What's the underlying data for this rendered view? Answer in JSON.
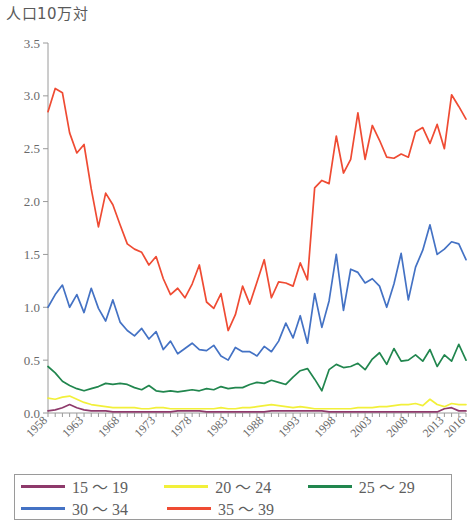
{
  "unit_label": "人口10万対",
  "legend": {
    "rows": [
      [
        {
          "label": "15 ～ 19",
          "color": "#8e3a6b"
        },
        {
          "label": "20 ～ 24",
          "color": "#f2f03a"
        },
        {
          "label": "25 ～ 29",
          "color": "#21864e"
        }
      ],
      [
        {
          "label": "30 ～ 34",
          "color": "#4472c4"
        },
        {
          "label": "35 ～ 39",
          "color": "#ef4b33"
        }
      ]
    ]
  },
  "chart_data": {
    "type": "line",
    "title": "",
    "subtitle": "",
    "xlabel": "",
    "ylabel": "人口10万対",
    "ylim": [
      0.0,
      3.5
    ],
    "ytick_labels": [
      "0.0",
      "0.5",
      "1.0",
      "1.5",
      "2.0",
      "2.5",
      "3.0",
      "3.5"
    ],
    "ytick_values": [
      0.0,
      0.5,
      1.0,
      1.5,
      2.0,
      2.5,
      3.0,
      3.5
    ],
    "xlim": [
      1958,
      2016
    ],
    "xtick_labels": [
      "1958",
      "1963",
      "1968",
      "1973",
      "1978",
      "1983",
      "1988",
      "1993",
      "1998",
      "2003",
      "2008",
      "2013",
      "2016"
    ],
    "xtick_values": [
      1958,
      1963,
      1968,
      1973,
      1978,
      1983,
      1988,
      1993,
      1998,
      2003,
      2008,
      2013,
      2016
    ],
    "grid": false,
    "legend_position": "bottom",
    "x": [
      1958,
      1959,
      1960,
      1961,
      1962,
      1963,
      1964,
      1965,
      1966,
      1967,
      1968,
      1969,
      1970,
      1971,
      1972,
      1973,
      1974,
      1975,
      1976,
      1977,
      1978,
      1979,
      1980,
      1981,
      1982,
      1983,
      1984,
      1985,
      1986,
      1987,
      1988,
      1989,
      1990,
      1991,
      1992,
      1993,
      1994,
      1995,
      1996,
      1997,
      1998,
      1999,
      2000,
      2001,
      2002,
      2003,
      2004,
      2005,
      2006,
      2007,
      2008,
      2009,
      2010,
      2011,
      2012,
      2013,
      2014,
      2015,
      2016
    ],
    "series": [
      {
        "name": "15 ～ 19",
        "color": "#8e3a6b",
        "values": [
          0.02,
          0.03,
          0.05,
          0.08,
          0.05,
          0.03,
          0.02,
          0.02,
          0.02,
          0.01,
          0.01,
          0.01,
          0.01,
          0.01,
          0.01,
          0.01,
          0.01,
          0.01,
          0.02,
          0.02,
          0.02,
          0.02,
          0.01,
          0.01,
          0.01,
          0.01,
          0.01,
          0.01,
          0.01,
          0.01,
          0.01,
          0.02,
          0.02,
          0.02,
          0.02,
          0.02,
          0.02,
          0.02,
          0.02,
          0.01,
          0.01,
          0.01,
          0.01,
          0.01,
          0.01,
          0.01,
          0.01,
          0.01,
          0.01,
          0.01,
          0.01,
          0.01,
          0.01,
          0.01,
          0.01,
          0.04,
          0.05,
          0.02,
          0.02
        ]
      },
      {
        "name": "20 ～ 24",
        "color": "#f2f03a",
        "values": [
          0.14,
          0.13,
          0.15,
          0.16,
          0.13,
          0.1,
          0.08,
          0.07,
          0.06,
          0.05,
          0.05,
          0.05,
          0.05,
          0.04,
          0.04,
          0.05,
          0.05,
          0.04,
          0.04,
          0.04,
          0.04,
          0.04,
          0.04,
          0.04,
          0.05,
          0.04,
          0.04,
          0.05,
          0.05,
          0.06,
          0.07,
          0.08,
          0.07,
          0.06,
          0.05,
          0.06,
          0.05,
          0.04,
          0.04,
          0.04,
          0.04,
          0.04,
          0.04,
          0.05,
          0.05,
          0.05,
          0.06,
          0.06,
          0.07,
          0.08,
          0.08,
          0.09,
          0.07,
          0.13,
          0.08,
          0.06,
          0.09,
          0.08,
          0.08
        ]
      },
      {
        "name": "25 ～ 29",
        "color": "#21864e",
        "values": [
          0.44,
          0.38,
          0.3,
          0.26,
          0.23,
          0.21,
          0.23,
          0.25,
          0.28,
          0.27,
          0.28,
          0.27,
          0.24,
          0.22,
          0.26,
          0.21,
          0.2,
          0.21,
          0.2,
          0.21,
          0.22,
          0.21,
          0.23,
          0.22,
          0.25,
          0.23,
          0.24,
          0.24,
          0.27,
          0.29,
          0.28,
          0.31,
          0.29,
          0.27,
          0.34,
          0.4,
          0.42,
          0.32,
          0.21,
          0.41,
          0.46,
          0.43,
          0.44,
          0.47,
          0.41,
          0.51,
          0.57,
          0.46,
          0.61,
          0.49,
          0.5,
          0.55,
          0.49,
          0.6,
          0.44,
          0.55,
          0.49,
          0.65,
          0.5
        ]
      },
      {
        "name": "30 ～ 34",
        "color": "#4472c4",
        "values": [
          1.0,
          1.12,
          1.21,
          1.0,
          1.12,
          0.95,
          1.18,
          0.99,
          0.87,
          1.07,
          0.86,
          0.78,
          0.73,
          0.8,
          0.7,
          0.77,
          0.6,
          0.68,
          0.56,
          0.61,
          0.66,
          0.6,
          0.59,
          0.64,
          0.54,
          0.5,
          0.62,
          0.58,
          0.58,
          0.54,
          0.63,
          0.58,
          0.68,
          0.85,
          0.71,
          0.92,
          0.66,
          1.13,
          0.81,
          1.06,
          1.5,
          0.97,
          1.36,
          1.33,
          1.23,
          1.27,
          1.2,
          1.0,
          1.22,
          1.51,
          1.07,
          1.38,
          1.54,
          1.78,
          1.5,
          1.55,
          1.62,
          1.6,
          1.45
        ]
      },
      {
        "name": "35 ～ 39",
        "color": "#ef4b33",
        "values": [
          2.85,
          3.07,
          3.03,
          2.65,
          2.46,
          2.54,
          2.12,
          1.76,
          2.08,
          1.97,
          1.78,
          1.6,
          1.55,
          1.52,
          1.4,
          1.48,
          1.27,
          1.12,
          1.18,
          1.09,
          1.22,
          1.4,
          1.05,
          0.99,
          1.13,
          0.78,
          0.93,
          1.2,
          1.03,
          1.24,
          1.45,
          1.09,
          1.24,
          1.23,
          1.2,
          1.42,
          1.26,
          2.13,
          2.2,
          2.17,
          2.62,
          2.27,
          2.4,
          2.84,
          2.4,
          2.72,
          2.58,
          2.42,
          2.41,
          2.45,
          2.42,
          2.66,
          2.7,
          2.55,
          2.73,
          2.5,
          3.01,
          2.9,
          2.78
        ]
      }
    ]
  }
}
